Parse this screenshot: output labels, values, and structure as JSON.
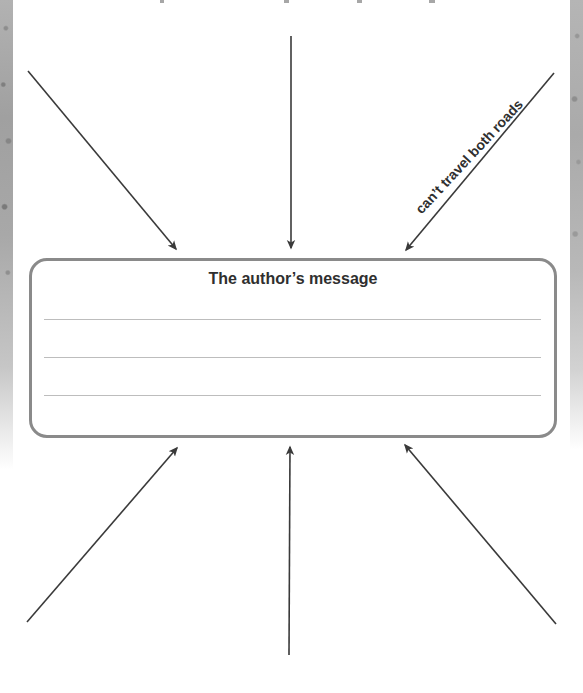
{
  "page": {
    "background_color": "#ffffff",
    "edge_texture_color": "#a8a8a8"
  },
  "diagram": {
    "center_box": {
      "title": "The author’s message",
      "border_color": "#8a8a8a",
      "writing_line_color": "#bdbdbd",
      "num_writing_lines": 3
    },
    "arrow_label": "can’t travel both roads",
    "arrow_color": "#3a3a3a",
    "arrows": [
      {
        "name": "top-left",
        "x1": 28,
        "y1": 71,
        "x2": 176,
        "y2": 249
      },
      {
        "name": "top-center",
        "x1": 291,
        "y1": 36,
        "x2": 291,
        "y2": 248
      },
      {
        "name": "top-right",
        "x1": 554,
        "y1": 73,
        "x2": 406,
        "y2": 250
      },
      {
        "name": "bottom-left",
        "x1": 27,
        "y1": 622,
        "x2": 177,
        "y2": 448
      },
      {
        "name": "bottom-center",
        "x1": 289,
        "y1": 655,
        "x2": 290,
        "y2": 447
      },
      {
        "name": "bottom-right",
        "x1": 556,
        "y1": 624,
        "x2": 405,
        "y2": 445
      }
    ]
  }
}
